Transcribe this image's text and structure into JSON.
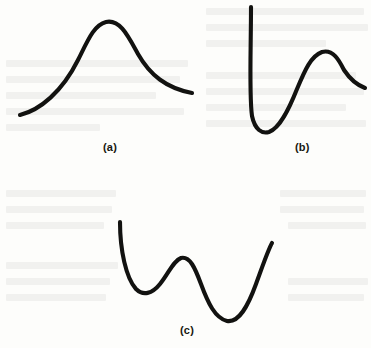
{
  "figure": {
    "background_color": "#fdfdfb",
    "ink_color": "#121210",
    "stroke_width": 4.1,
    "width": 371,
    "height": 348,
    "bleed_through_color": "#efefec"
  },
  "panels": [
    {
      "id": "a",
      "caption": "(a)",
      "caption_x": 103,
      "caption_y": 141,
      "shape": "single-hump-bell",
      "path": "M 20 115 C 40 110, 62 92, 78 60 C 88 40, 94 25, 106 22 C 120 19, 128 36, 138 54 C 150 75, 166 88, 192 93"
    },
    {
      "id": "b",
      "caption": "(b)",
      "caption_x": 295,
      "caption_y": 141,
      "shape": "steep-drop-well-then-peak",
      "path": "M 251 7 C 251 48, 249 96, 252 116 C 255 130, 262 134, 269 132 C 280 128, 289 109, 297 89 C 305 70, 311 56, 322 52 C 333 49, 339 60, 344 70 C 350 79, 357 85, 365 88"
    },
    {
      "id": "c",
      "caption": "(c)",
      "caption_x": 180,
      "caption_y": 324,
      "shape": "double-well-w-curve",
      "path": "M 120 222 C 120 250, 126 278, 136 289 C 143 296, 152 294, 160 284 C 169 273, 173 261, 181 258 C 190 256, 195 268, 201 284 C 208 303, 215 318, 227 321 C 239 323, 248 306, 256 284 C 263 265, 268 250, 272 243"
    }
  ],
  "bleed_text_lines": [
    {
      "x": 6,
      "y": 60,
      "w": 182
    },
    {
      "x": 6,
      "y": 76,
      "w": 174
    },
    {
      "x": 6,
      "y": 92,
      "w": 150
    },
    {
      "x": 6,
      "y": 108,
      "w": 178
    },
    {
      "x": 6,
      "y": 124,
      "w": 94
    },
    {
      "x": 206,
      "y": 8,
      "w": 158
    },
    {
      "x": 206,
      "y": 24,
      "w": 162
    },
    {
      "x": 206,
      "y": 40,
      "w": 120
    },
    {
      "x": 206,
      "y": 72,
      "w": 150
    },
    {
      "x": 206,
      "y": 88,
      "w": 158
    },
    {
      "x": 206,
      "y": 104,
      "w": 140
    },
    {
      "x": 206,
      "y": 120,
      "w": 160
    },
    {
      "x": 6,
      "y": 190,
      "w": 110
    },
    {
      "x": 6,
      "y": 206,
      "w": 106
    },
    {
      "x": 6,
      "y": 222,
      "w": 98
    },
    {
      "x": 6,
      "y": 262,
      "w": 112
    },
    {
      "x": 6,
      "y": 278,
      "w": 104
    },
    {
      "x": 6,
      "y": 294,
      "w": 100
    },
    {
      "x": 280,
      "y": 190,
      "w": 86
    },
    {
      "x": 280,
      "y": 206,
      "w": 84
    },
    {
      "x": 288,
      "y": 222,
      "w": 78
    },
    {
      "x": 288,
      "y": 278,
      "w": 80
    },
    {
      "x": 288,
      "y": 294,
      "w": 76
    }
  ]
}
